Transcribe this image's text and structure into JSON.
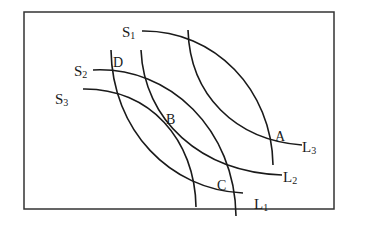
{
  "diagram": {
    "border": {
      "x": 24,
      "y": 12,
      "width": 310,
      "height": 197,
      "color": "#333333"
    },
    "stroke_color": "#1a1a1a",
    "curves": [
      {
        "id": "S1",
        "label": "S",
        "sub": "1",
        "label_x": 122,
        "label_y": 37
      },
      {
        "id": "S2",
        "label": "S",
        "sub": "2",
        "label_x": 74,
        "label_y": 76
      },
      {
        "id": "S3",
        "label": "S",
        "sub": "3",
        "label_x": 55,
        "label_y": 104
      },
      {
        "id": "L1",
        "label": "L",
        "sub": "1",
        "label_x": 254,
        "label_y": 209
      },
      {
        "id": "L2",
        "label": "L",
        "sub": "2",
        "label_x": 283,
        "label_y": 182
      },
      {
        "id": "L3",
        "label": "L",
        "sub": "3",
        "label_x": 302,
        "label_y": 152
      }
    ],
    "points": [
      {
        "label": "A",
        "x": 275,
        "y": 141
      },
      {
        "label": "B",
        "x": 166,
        "y": 124
      },
      {
        "label": "C",
        "x": 218,
        "y": 190
      },
      {
        "label": "D",
        "x": 113,
        "y": 66
      }
    ]
  }
}
